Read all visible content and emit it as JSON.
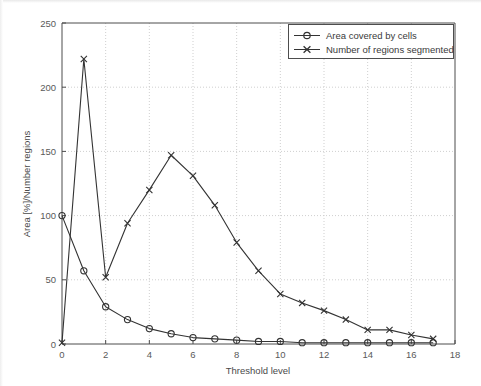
{
  "figure": {
    "background_color": "#ffffff",
    "axis_color": "#4d4d4d",
    "grid_color": "#cfcfcf",
    "series_color": "#333333"
  },
  "chart_data": {
    "type": "line",
    "title": "",
    "subtitle": "",
    "xlabel": "Threshold level",
    "ylabel": "Area [%]/Number regions",
    "xlim": [
      0,
      18
    ],
    "ylim": [
      0,
      250
    ],
    "xticks": [
      0,
      2,
      4,
      6,
      8,
      10,
      12,
      14,
      16,
      18
    ],
    "xtick_labels": [
      "0",
      "2",
      "4",
      "6",
      "8",
      "10",
      "12",
      "14",
      "16",
      "18"
    ],
    "yticks": [
      0,
      50,
      100,
      150,
      200,
      250
    ],
    "ytick_labels": [
      "0",
      "50",
      "100",
      "150",
      "200",
      "250"
    ],
    "grid": true,
    "grid_style": "dotted",
    "legend_position": "top-right",
    "x": [
      0,
      1,
      2,
      3,
      4,
      5,
      6,
      7,
      8,
      9,
      10,
      11,
      12,
      13,
      14,
      15,
      16,
      17
    ],
    "series": [
      {
        "name": "Area covered by cells",
        "marker": "circle",
        "values": [
          100,
          57,
          29,
          19,
          12,
          8,
          5,
          4,
          3,
          2,
          2,
          1,
          1,
          1,
          1,
          1,
          1,
          1
        ]
      },
      {
        "name": "Number of regions segmented",
        "marker": "x",
        "values": [
          1,
          222,
          52,
          94,
          120,
          147,
          131,
          108,
          79,
          57,
          39,
          32,
          26,
          19,
          11,
          11,
          7,
          4
        ]
      }
    ]
  },
  "legend": {
    "entries": [
      {
        "label": "Area covered by cells",
        "marker": "circle-marker"
      },
      {
        "label": "Number of regions segmented",
        "marker": "x-marker"
      }
    ]
  }
}
